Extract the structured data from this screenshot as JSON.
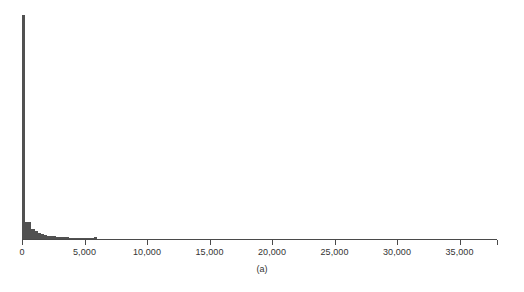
{
  "figure": {
    "caption": "(a)",
    "background_color": "#ffffff",
    "bar_color": "#515151",
    "axis_color": "#4a4a4a",
    "text_color": "#333333"
  },
  "chart_data": {
    "type": "bar",
    "title": "",
    "subtitle": "",
    "xlabel": "",
    "ylabel": "",
    "caption": "(a)",
    "grid": false,
    "legend": null,
    "xlim": [
      0,
      38000
    ],
    "ylim": [
      0,
      1.0
    ],
    "xtick_labels": [
      "0",
      "5,000",
      "10,000",
      "15,000",
      "20,000",
      "25,000",
      "30,000",
      "35,000"
    ],
    "xtick_values": [
      0,
      5000,
      10000,
      15000,
      20000,
      25000,
      30000,
      35000
    ],
    "ytick_labels": [],
    "bin_width": 250,
    "note": "Highly right-skewed (long-tail) histogram; first bin dominates, frequencies normalized to the tallest bar = 1.0",
    "x": [
      125,
      375,
      625,
      875,
      1125,
      1375,
      1625,
      1875,
      2125,
      2375,
      2625,
      2875,
      3125,
      3375,
      3625,
      3875,
      4125,
      4375,
      4625,
      4875,
      5125,
      5375,
      5625,
      5875,
      6125,
      6375,
      6625,
      7125,
      7625,
      17250
    ],
    "values": [
      1.0,
      0.082,
      0.079,
      0.049,
      0.042,
      0.033,
      0.026,
      0.022,
      0.02,
      0.018,
      0.016,
      0.015,
      0.014,
      0.013,
      0.012,
      0.011,
      0.011,
      0.01,
      0.009,
      0.009,
      0.008,
      0.008,
      0.007,
      0.012,
      0.006,
      0.006,
      0.005,
      0.005,
      0.004,
      0.006
    ]
  }
}
